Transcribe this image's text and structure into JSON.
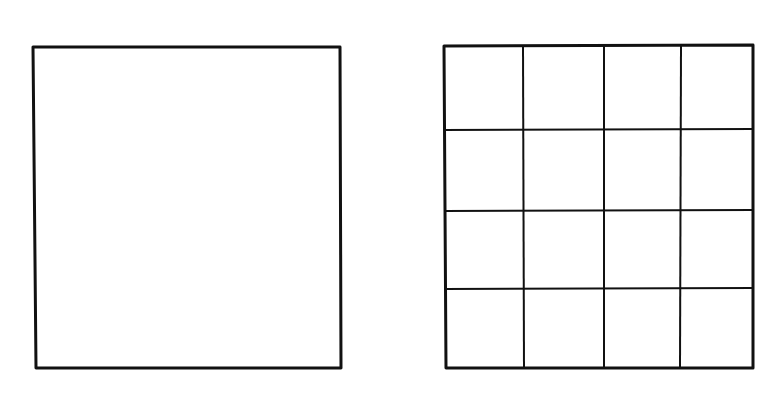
{
  "diagram": {
    "colors": {
      "background": "#ffffff",
      "stroke": "#111111"
    },
    "panels": [
      {
        "id": "empty-square",
        "x1": 33,
        "y1": 47,
        "x2": 341,
        "y2": 368,
        "rows": 1,
        "cols": 1
      },
      {
        "id": "grid-square",
        "x1": 444,
        "y1": 45,
        "x2": 753,
        "y2": 368,
        "rows": 4,
        "cols": 4,
        "vertical_lines_x": [
          524,
          604,
          680
        ],
        "horizontal_lines_y": [
          130,
          211,
          289
        ]
      }
    ]
  }
}
